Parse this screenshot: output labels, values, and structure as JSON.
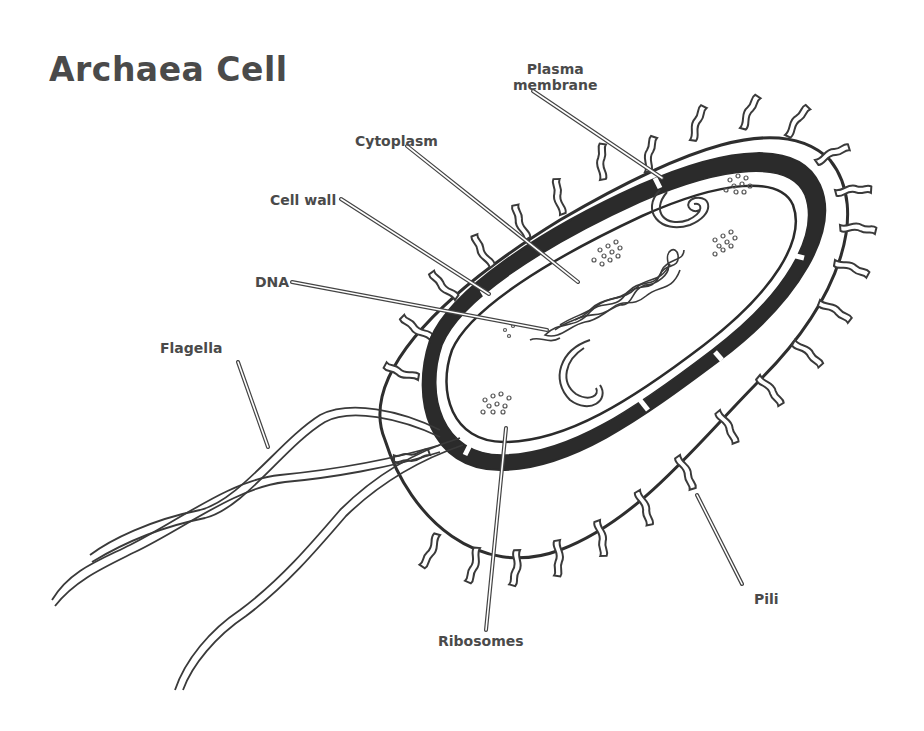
{
  "diagram": {
    "title": "Archaea Cell",
    "labels": {
      "plasma_membrane_line1": "Plasma",
      "plasma_membrane_line2": "membrane",
      "cytoplasm": "Cytoplasm",
      "cell_wall": "Cell wall",
      "dna": "DNA",
      "flagella": "Flagella",
      "pili": "Pili",
      "ribosomes": "Ribosomes"
    },
    "structures": [
      "Plasma membrane",
      "Cytoplasm",
      "Cell wall",
      "DNA",
      "Flagella",
      "Pili",
      "Ribosomes"
    ],
    "colors": {
      "ink": "#3a3a3a",
      "wall_fill": "#2b2b2b",
      "label_text": "#4a4a4a",
      "background": "#ffffff"
    }
  }
}
